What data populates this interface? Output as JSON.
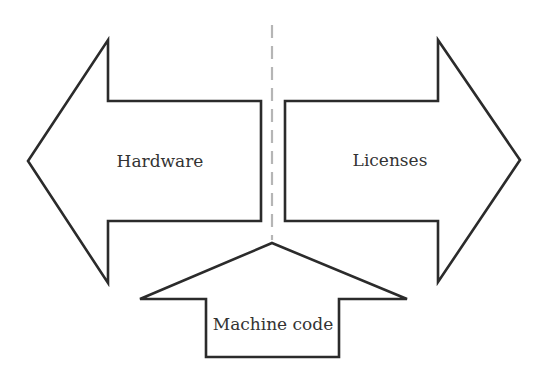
{
  "diagram": {
    "divider": {
      "style": "dashed",
      "color": "#b5b5b5"
    },
    "arrows": [
      {
        "id": "hardware",
        "direction": "left",
        "label": "Hardware"
      },
      {
        "id": "licenses",
        "direction": "right",
        "label": "Licenses"
      },
      {
        "id": "machine-code",
        "direction": "up",
        "label": "Machine code"
      }
    ],
    "stroke_color": "#2b2b2b"
  }
}
